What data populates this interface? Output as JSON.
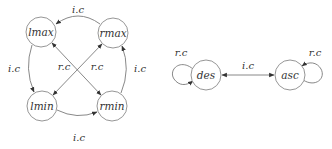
{
  "diagram": {
    "left_graph": {
      "nodes": [
        {
          "id": "lmax",
          "label": "lmax"
        },
        {
          "id": "rmax",
          "label": "rmax"
        },
        {
          "id": "lmin",
          "label": "lmin"
        },
        {
          "id": "rmin",
          "label": "rmin"
        }
      ],
      "edges": [
        {
          "from": "rmax",
          "to": "lmax",
          "label": "i.c"
        },
        {
          "from": "lmax",
          "to": "lmin",
          "label": "i.c"
        },
        {
          "from": "rmin",
          "to": "rmax",
          "label": "i.c"
        },
        {
          "from": "lmin",
          "to": "rmin",
          "label": "i.c"
        },
        {
          "from": "rmax",
          "to": "lmin",
          "label": "r.c",
          "bidirectional": true
        },
        {
          "from": "lmax",
          "to": "rmin",
          "label": "r.c",
          "bidirectional": true
        }
      ]
    },
    "right_graph": {
      "nodes": [
        {
          "id": "des",
          "label": "des"
        },
        {
          "id": "asc",
          "label": "asc"
        }
      ],
      "edges": [
        {
          "from": "des",
          "to": "des",
          "label": "r.c"
        },
        {
          "from": "asc",
          "to": "asc",
          "label": "r.c"
        },
        {
          "from": "des",
          "to": "asc",
          "label": "i.c",
          "bidirectional": true
        }
      ]
    }
  }
}
